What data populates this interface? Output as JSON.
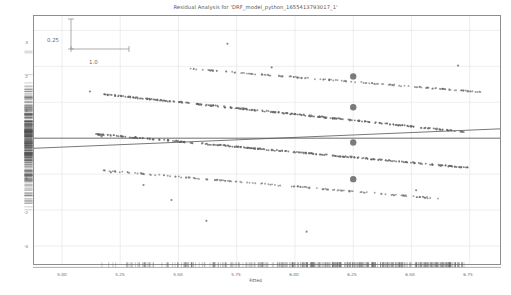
{
  "chart_data": {
    "type": "scatter",
    "title": "Residual Analysis for 'DRF_model_python_1655413793017_1'",
    "xlabel": "Fitted",
    "ylabel": "Residuals",
    "xlim": [
      4.88,
      6.88
    ],
    "ylim": [
      -3.5,
      3.4
    ],
    "xticks": [
      "5.00",
      "5.25",
      "5.50",
      "5.75",
      "6.00",
      "6.25",
      "6.50",
      "6.75"
    ],
    "xtick_values": [
      5.0,
      5.25,
      5.5,
      5.75,
      6.0,
      6.25,
      6.5,
      6.75
    ],
    "yticks": [
      "3",
      "2",
      "1",
      "0",
      "-1",
      "-2",
      "-3"
    ],
    "ytick_values": [
      3,
      2,
      1,
      0,
      -1,
      -2,
      -3
    ],
    "grid": true,
    "legend": "none",
    "marker_color": "#666666",
    "line_color": "#555555",
    "highlight_color": "#707070",
    "scale_legend": {
      "vertical_label": "0.25",
      "horizontal_label": "1.0",
      "vertical_units": 0.25,
      "horizontal_units": 1.0
    },
    "reference_line": {
      "type": "horizontal",
      "y": 0
    },
    "trend_line": {
      "type": "linear",
      "x0": 4.88,
      "y0": -0.28,
      "x1": 6.88,
      "y1": 0.26
    },
    "bands": [
      {
        "name": "band-3",
        "target": 7,
        "x0": 5.52,
        "y0": 1.95,
        "x1": 6.8,
        "y1": 1.28,
        "density": "sparse"
      },
      {
        "name": "band-2",
        "target": 6,
        "x0": 5.18,
        "y0": 1.22,
        "x1": 6.72,
        "y1": 0.18,
        "density": "dense"
      },
      {
        "name": "band-1",
        "target": 5,
        "x0": 5.14,
        "y0": 0.12,
        "x1": 6.74,
        "y1": -0.82,
        "density": "dense"
      },
      {
        "name": "band-0",
        "target": 4,
        "x0": 5.18,
        "y0": -0.9,
        "x1": 6.62,
        "y1": -1.68,
        "density": "sparse"
      }
    ],
    "highlighted_points": [
      {
        "x": 6.25,
        "y": 1.72
      },
      {
        "x": 6.25,
        "y": 0.86
      },
      {
        "x": 6.25,
        "y": -0.12
      },
      {
        "x": 6.25,
        "y": -1.14
      }
    ],
    "outliers": [
      {
        "x": 5.71,
        "y": 2.63
      },
      {
        "x": 5.9,
        "y": 1.97
      },
      {
        "x": 6.7,
        "y": 2.02
      },
      {
        "x": 5.12,
        "y": 1.3
      },
      {
        "x": 5.17,
        "y": 0.05
      },
      {
        "x": 5.21,
        "y": -0.95
      },
      {
        "x": 5.47,
        "y": -1.72
      },
      {
        "x": 5.62,
        "y": -2.3
      },
      {
        "x": 6.05,
        "y": -2.6
      },
      {
        "x": 6.52,
        "y": -1.45
      },
      {
        "x": 5.35,
        "y": -1.3
      }
    ],
    "rug_x": {
      "position": "bottom",
      "count": 420
    },
    "rug_y": {
      "position": "left",
      "count": 380
    }
  }
}
